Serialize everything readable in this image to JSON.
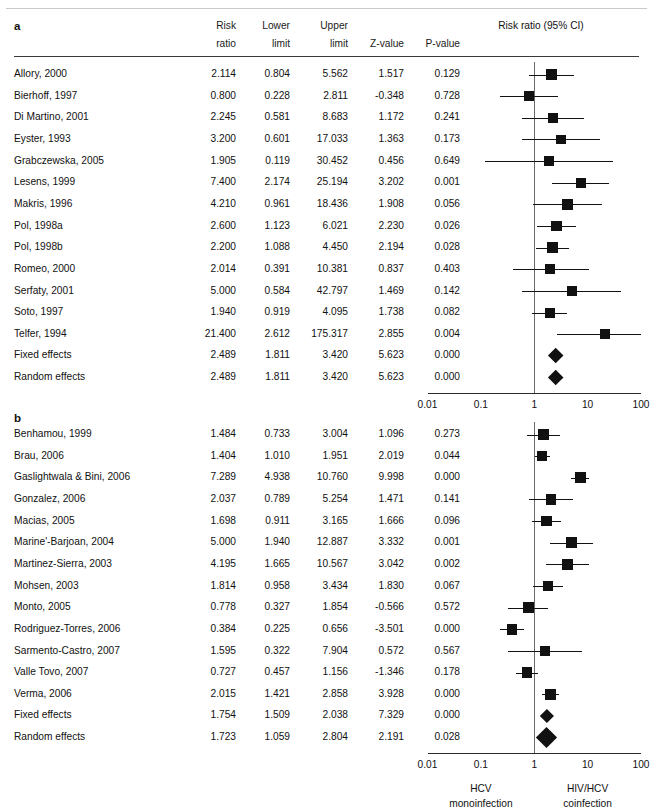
{
  "figure": {
    "plot_title": "Risk ratio (95% CI)",
    "columns": [
      "Risk ratio",
      "Lower limit",
      "Upper limit",
      "Z-value",
      "P-value"
    ],
    "column_line1": [
      "Risk",
      "Lower",
      "Upper",
      "",
      ""
    ],
    "column_line2": [
      "ratio",
      "limit",
      "limit",
      "Z-value",
      "P-value"
    ],
    "axis": {
      "ticks": [
        "0.01",
        "0.1",
        "1",
        "10",
        "100"
      ],
      "tick_values": [
        0.01,
        0.1,
        1,
        10,
        100
      ],
      "scale": "log",
      "null_value": 1
    },
    "footer": {
      "left_line1": "HCV",
      "left_line2": "monoinfection",
      "right_line1": "HIV/HCV",
      "right_line2": "coinfection"
    }
  },
  "chart_data": {
    "type": "forest",
    "title": "Risk ratio (95% CI)",
    "xlabel": "Risk ratio",
    "xscale": "log",
    "xlim": [
      0.01,
      100
    ],
    "xticks": [
      0.01,
      0.1,
      1,
      10,
      100
    ],
    "xtick_labels": [
      "0.01",
      "0.1",
      "1",
      "10",
      "100"
    ],
    "null_line": 1,
    "grid": false,
    "legend": "none",
    "panels": [
      {
        "label": "a",
        "columns": [
          "Study",
          "Risk ratio",
          "Lower limit",
          "Upper limit",
          "Z-value",
          "P-value"
        ],
        "rows": [
          {
            "study": "Allory, 2000",
            "rr": "2.114",
            "lower": "0.804",
            "upper": "5.562",
            "z": "1.517",
            "p": "0.129",
            "v": 2.114,
            "lo": 0.804,
            "hi": 5.562,
            "w": 0.52,
            "summary": false
          },
          {
            "study": "Bierhoff, 1997",
            "rr": "0.800",
            "lower": "0.228",
            "upper": "2.811",
            "z": "-0.348",
            "p": "0.728",
            "v": 0.8,
            "lo": 0.228,
            "hi": 2.811,
            "w": 0.45,
            "summary": false
          },
          {
            "study": "Di Martino, 2001",
            "rr": "2.245",
            "lower": "0.581",
            "upper": "8.683",
            "z": "1.172",
            "p": "0.241",
            "v": 2.245,
            "lo": 0.581,
            "hi": 8.683,
            "w": 0.45,
            "summary": false
          },
          {
            "study": "Eyster, 1993",
            "rr": "3.200",
            "lower": "0.601",
            "upper": "17.033",
            "z": "1.363",
            "p": "0.173",
            "v": 3.2,
            "lo": 0.601,
            "hi": 17.033,
            "w": 0.42,
            "summary": false
          },
          {
            "study": "Grabczewska, 2005",
            "rr": "1.905",
            "lower": "0.119",
            "upper": "30.452",
            "z": "0.456",
            "p": "0.649",
            "v": 1.905,
            "lo": 0.119,
            "hi": 30.452,
            "w": 0.4,
            "summary": false
          },
          {
            "study": "Lesens, 1999",
            "rr": "7.400",
            "lower": "2.174",
            "upper": "25.194",
            "z": "3.202",
            "p": "0.001",
            "v": 7.4,
            "lo": 2.174,
            "hi": 25.194,
            "w": 0.45,
            "summary": false
          },
          {
            "study": "Makris, 1996",
            "rr": "4.210",
            "lower": "0.961",
            "upper": "18.436",
            "z": "1.908",
            "p": "0.056",
            "v": 4.21,
            "lo": 0.961,
            "hi": 18.436,
            "w": 0.47,
            "summary": false
          },
          {
            "study": "Pol, 1998a",
            "rr": "2.600",
            "lower": "1.123",
            "upper": "6.021",
            "z": "2.230",
            "p": "0.026",
            "v": 2.6,
            "lo": 1.123,
            "hi": 6.021,
            "w": 0.5,
            "summary": false
          },
          {
            "study": "Pol, 1998b",
            "rr": "2.200",
            "lower": "1.088",
            "upper": "4.450",
            "z": "2.194",
            "p": "0.028",
            "v": 2.2,
            "lo": 1.088,
            "hi": 4.45,
            "w": 0.52,
            "summary": false
          },
          {
            "study": "Romeo, 2000",
            "rr": "2.014",
            "lower": "0.391",
            "upper": "10.381",
            "z": "0.837",
            "p": "0.403",
            "v": 2.014,
            "lo": 0.391,
            "hi": 10.381,
            "w": 0.44,
            "summary": false
          },
          {
            "study": "Serfaty, 2001",
            "rr": "5.000",
            "lower": "0.584",
            "upper": "42.797",
            "z": "1.469",
            "p": "0.142",
            "v": 5.0,
            "lo": 0.584,
            "hi": 42.797,
            "w": 0.44,
            "summary": false
          },
          {
            "study": "Soto, 1997",
            "rr": "1.940",
            "lower": "0.919",
            "upper": "4.095",
            "z": "1.738",
            "p": "0.082",
            "v": 1.94,
            "lo": 0.919,
            "hi": 4.095,
            "w": 0.47,
            "summary": false
          },
          {
            "study": "Telfer, 1994",
            "rr": "21.400",
            "lower": "2.612",
            "upper": "175.317",
            "z": "2.855",
            "p": "0.004",
            "v": 21.4,
            "lo": 2.612,
            "hi": 175.317,
            "w": 0.48,
            "summary": false
          },
          {
            "study": "Fixed effects",
            "rr": "2.489",
            "lower": "1.811",
            "upper": "3.420",
            "z": "5.623",
            "p": "0.000",
            "v": 2.489,
            "lo": 1.811,
            "hi": 3.42,
            "w": 0.6,
            "summary": true
          },
          {
            "study": "Random effects",
            "rr": "2.489",
            "lower": "1.811",
            "upper": "3.420",
            "z": "5.623",
            "p": "0.000",
            "v": 2.489,
            "lo": 1.811,
            "hi": 3.42,
            "w": 0.6,
            "summary": true
          }
        ]
      },
      {
        "label": "b",
        "columns": [
          "Study",
          "Risk ratio",
          "Lower limit",
          "Upper limit",
          "Z-value",
          "P-value"
        ],
        "rows": [
          {
            "study": "Benhamou, 1999",
            "rr": "1.484",
            "lower": "0.733",
            "upper": "3.004",
            "z": "1.096",
            "p": "0.273",
            "v": 1.484,
            "lo": 0.733,
            "hi": 3.004,
            "w": 0.5,
            "summary": false
          },
          {
            "study": "Brau, 2006",
            "rr": "1.404",
            "lower": "1.010",
            "upper": "1.951",
            "z": "2.019",
            "p": "0.044",
            "v": 1.404,
            "lo": 1.01,
            "hi": 1.951,
            "w": 0.52,
            "summary": false
          },
          {
            "study": "Gaslightwala & Bini, 2006",
            "rr": "7.289",
            "lower": "4.938",
            "upper": "10.760",
            "z": "9.998",
            "p": "0.000",
            "v": 7.289,
            "lo": 4.938,
            "hi": 10.76,
            "w": 0.55,
            "summary": false
          },
          {
            "study": "Gonzalez, 2006",
            "rr": "2.037",
            "lower": "0.789",
            "upper": "5.254",
            "z": "1.471",
            "p": "0.141",
            "v": 2.037,
            "lo": 0.789,
            "hi": 5.254,
            "w": 0.5,
            "summary": false
          },
          {
            "study": "Macias, 2005",
            "rr": "1.698",
            "lower": "0.911",
            "upper": "3.165",
            "z": "1.666",
            "p": "0.096",
            "v": 1.698,
            "lo": 0.911,
            "hi": 3.165,
            "w": 0.52,
            "summary": false
          },
          {
            "study": "Marine'-Barjoan, 2004",
            "rr": "5.000",
            "lower": "1.940",
            "upper": "12.887",
            "z": "3.332",
            "p": "0.001",
            "v": 5.0,
            "lo": 1.94,
            "hi": 12.887,
            "w": 0.55,
            "summary": false
          },
          {
            "study": "Martinez-Sierra, 2003",
            "rr": "4.195",
            "lower": "1.665",
            "upper": "10.567",
            "z": "3.042",
            "p": "0.002",
            "v": 4.195,
            "lo": 1.665,
            "hi": 10.567,
            "w": 0.53,
            "summary": false
          },
          {
            "study": "Mohsen, 2003",
            "rr": "1.814",
            "lower": "0.958",
            "upper": "3.434",
            "z": "1.830",
            "p": "0.067",
            "v": 1.814,
            "lo": 0.958,
            "hi": 3.434,
            "w": 0.5,
            "summary": false
          },
          {
            "study": "Monto, 2005",
            "rr": "0.778",
            "lower": "0.327",
            "upper": "1.854",
            "z": "-0.566",
            "p": "0.572",
            "v": 0.778,
            "lo": 0.327,
            "hi": 1.854,
            "w": 0.5,
            "summary": false
          },
          {
            "study": "Rodriguez-Torres, 2006",
            "rr": "0.384",
            "lower": "0.225",
            "upper": "0.656",
            "z": "-3.501",
            "p": "0.000",
            "v": 0.384,
            "lo": 0.225,
            "hi": 0.656,
            "w": 0.5,
            "summary": false
          },
          {
            "study": "Sarmento-Castro, 2007",
            "rr": "1.595",
            "lower": "0.322",
            "upper": "7.904",
            "z": "0.572",
            "p": "0.567",
            "v": 1.595,
            "lo": 0.322,
            "hi": 7.904,
            "w": 0.53,
            "summary": false
          },
          {
            "study": "Valle Tovo, 2007",
            "rr": "0.727",
            "lower": "0.457",
            "upper": "1.156",
            "z": "-1.346",
            "p": "0.178",
            "v": 0.727,
            "lo": 0.457,
            "hi": 1.156,
            "w": 0.52,
            "summary": false
          },
          {
            "study": "Verma, 2006",
            "rr": "2.015",
            "lower": "1.421",
            "upper": "2.858",
            "z": "3.928",
            "p": "0.000",
            "v": 2.015,
            "lo": 1.421,
            "hi": 2.858,
            "w": 0.5,
            "summary": false
          },
          {
            "study": "Fixed effects",
            "rr": "1.754",
            "lower": "1.509",
            "upper": "2.038",
            "z": "7.329",
            "p": "0.000",
            "v": 1.754,
            "lo": 1.509,
            "hi": 2.038,
            "w": 0.42,
            "summary": true
          },
          {
            "study": "Random effects",
            "rr": "1.723",
            "lower": "1.059",
            "upper": "2.804",
            "z": "2.191",
            "p": "0.028",
            "v": 1.723,
            "lo": 1.059,
            "hi": 2.804,
            "w": 1.0,
            "summary": true
          }
        ]
      }
    ]
  }
}
